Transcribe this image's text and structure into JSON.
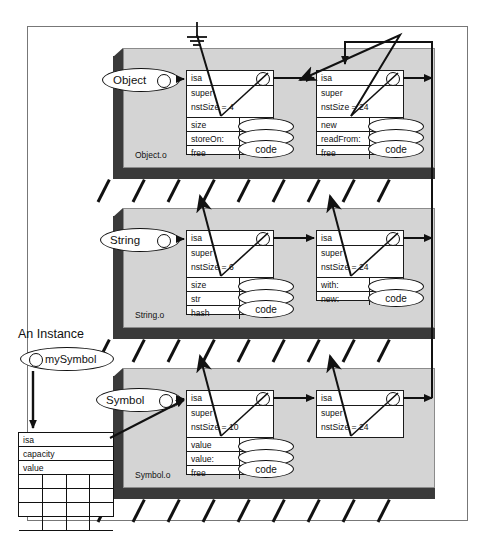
{
  "diagram": {
    "title_instance": "An Instance",
    "ground_symbol": "ground-icon",
    "instance": {
      "name": "mySymbol",
      "fields": [
        "isa",
        "capacity",
        "value"
      ],
      "grid_rows": 4,
      "grid_cols": 4
    },
    "object_files": [
      {
        "file_label": "Object.o",
        "class_name": "Object",
        "class": {
          "header_rows": [
            "isa",
            "super",
            "nstSize = 4"
          ],
          "methods": [
            "size",
            "storeOn:",
            "free"
          ],
          "code_label": "code"
        },
        "metaclass": {
          "header_rows": [
            "isa",
            "super",
            "nstSize = 24"
          ],
          "methods": [
            "new",
            "readFrom:",
            "free"
          ],
          "code_label": "code"
        }
      },
      {
        "file_label": "String.o",
        "class_name": "String",
        "class": {
          "header_rows": [
            "isa",
            "super",
            "nstSize = 6"
          ],
          "methods": [
            "size",
            "str",
            "hash"
          ],
          "code_label": "code"
        },
        "metaclass": {
          "header_rows": [
            "isa",
            "super",
            "nstSize = 24"
          ],
          "methods": [
            "with:",
            "new:"
          ],
          "code_label": "code"
        }
      },
      {
        "file_label": "Symbol.o",
        "class_name": "Symbol",
        "class": {
          "header_rows": [
            "isa",
            "super",
            "nstSize = 10"
          ],
          "methods": [
            "value",
            "value:",
            "free"
          ],
          "code_label": "code"
        },
        "metaclass": {
          "header_rows": [
            "isa",
            "super",
            "nstSize = 24"
          ],
          "methods": [],
          "code_label": ""
        }
      }
    ],
    "colors": {
      "panel_face": "#d4d4d4",
      "panel_edge": "#3a3a3a",
      "frame_border": "#777777",
      "ink": "#111111",
      "box_fill": "#ffffff"
    }
  }
}
